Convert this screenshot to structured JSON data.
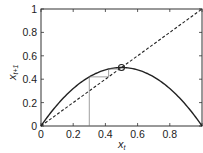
{
  "chart_data": {
    "type": "line",
    "title": "",
    "xlabel": "x_t",
    "ylabel": "x_{t+1}",
    "xlim": [
      0,
      1
    ],
    "ylim": [
      0,
      1
    ],
    "xticks": [
      "0",
      "0.2",
      "0.4",
      "0.6",
      "0.8"
    ],
    "yticks": [
      "0",
      "0.2",
      "0.4",
      "0.6",
      "0.8",
      "1"
    ],
    "grid": false,
    "series": [
      {
        "name": "logistic map x_{t+1} = 2 x_t (1 - x_t)",
        "style": "solid",
        "x": [
          0,
          0.1,
          0.2,
          0.3,
          0.4,
          0.5,
          0.6,
          0.7,
          0.8,
          0.9,
          1.0
        ],
        "values": [
          0,
          0.18,
          0.32,
          0.42,
          0.48,
          0.5,
          0.48,
          0.42,
          0.32,
          0.18,
          0
        ]
      },
      {
        "name": "identity x_{t+1} = x_t",
        "style": "dashed",
        "x": [
          0,
          1
        ],
        "values": [
          0,
          1
        ]
      },
      {
        "name": "cobweb",
        "style": "thin",
        "x": [
          0.3,
          0.3,
          0.42,
          0.42,
          0.487
        ],
        "values": [
          0,
          0.42,
          0.42,
          0.487,
          0.487
        ]
      }
    ],
    "annotations": [
      {
        "type": "circle-marker",
        "x": 0.5,
        "y": 0.5,
        "label": "fixed point"
      }
    ]
  },
  "axis": {
    "xlabel_main": "x",
    "xlabel_sub": "t",
    "ylabel_main": "x",
    "ylabel_sub": "t+1",
    "xtick_labels": [
      "0",
      "0.2",
      "0.4",
      "0.6",
      "0.8"
    ],
    "ytick_labels": [
      "0",
      "0.2",
      "0.4",
      "0.6",
      "0.8",
      "1"
    ]
  }
}
